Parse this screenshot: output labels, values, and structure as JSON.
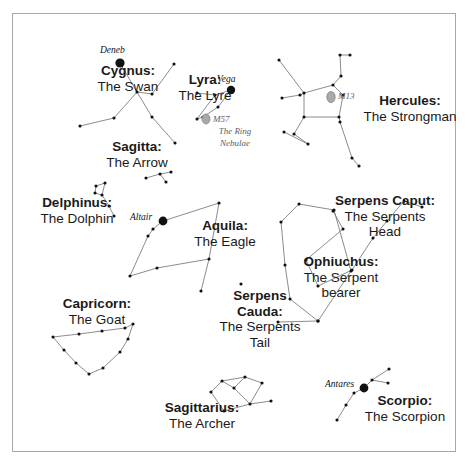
{
  "figure": {
    "kind": "star-chart",
    "background_color": "#ffffff",
    "frame_color": "#a8a8a8",
    "line_color": "#6f6f6f",
    "star_color": "#111111",
    "deepsky_fill": "#a9a9a9"
  },
  "constellations": [
    {
      "key": "cygnus",
      "name": "Cygnus:",
      "common": "The Swan",
      "label": {
        "x": 72,
        "y": 63,
        "w": 112
      },
      "stars": [
        {
          "x": 120,
          "y": 63,
          "r": 4.6,
          "name": "Deneb"
        },
        {
          "x": 137,
          "y": 92
        },
        {
          "x": 152,
          "y": 117
        },
        {
          "x": 175,
          "y": 143
        },
        {
          "x": 174,
          "y": 64
        },
        {
          "x": 152,
          "y": 94
        },
        {
          "x": 114,
          "y": 118
        },
        {
          "x": 80,
          "y": 126
        }
      ],
      "lines": [
        [
          0,
          1
        ],
        [
          1,
          2
        ],
        [
          2,
          3
        ],
        [
          4,
          5
        ],
        [
          5,
          1
        ],
        [
          1,
          6
        ],
        [
          6,
          7
        ]
      ]
    },
    {
      "key": "lyra",
      "name": "Lyra:",
      "common": "The Lyre",
      "label": {
        "x": 166,
        "y": 72,
        "w": 78
      },
      "stars": [
        {
          "x": 231,
          "y": 90,
          "r": 4.2,
          "name": "Vega"
        },
        {
          "x": 215,
          "y": 95
        },
        {
          "x": 197,
          "y": 93
        },
        {
          "x": 218,
          "y": 107
        },
        {
          "x": 203,
          "y": 117
        },
        {
          "x": 197,
          "y": 119
        }
      ],
      "lines": [
        [
          0,
          1
        ],
        [
          1,
          2
        ],
        [
          0,
          3
        ],
        [
          3,
          4
        ],
        [
          4,
          5
        ],
        [
          5,
          1
        ]
      ]
    },
    {
      "key": "hercules",
      "name": "Hercules:",
      "common": "The Strongman",
      "label": {
        "x": 358,
        "y": 93,
        "w": 104
      },
      "stars": [
        {
          "x": 343,
          "y": 95
        },
        {
          "x": 333,
          "y": 85
        },
        {
          "x": 304,
          "y": 93
        },
        {
          "x": 304,
          "y": 117
        },
        {
          "x": 339,
          "y": 117
        },
        {
          "x": 341,
          "y": 76
        },
        {
          "x": 340,
          "y": 55
        },
        {
          "x": 350,
          "y": 55
        },
        {
          "x": 300,
          "y": 95
        },
        {
          "x": 282,
          "y": 98
        },
        {
          "x": 279,
          "y": 60
        },
        {
          "x": 294,
          "y": 134
        },
        {
          "x": 308,
          "y": 144
        },
        {
          "x": 284,
          "y": 132
        },
        {
          "x": 340,
          "y": 122
        },
        {
          "x": 352,
          "y": 158
        },
        {
          "x": 359,
          "y": 166
        }
      ],
      "lines": [
        [
          1,
          2
        ],
        [
          2,
          3
        ],
        [
          3,
          4
        ],
        [
          4,
          0
        ],
        [
          0,
          1
        ],
        [
          1,
          5
        ],
        [
          5,
          6
        ],
        [
          6,
          7
        ],
        [
          2,
          8
        ],
        [
          8,
          9
        ],
        [
          2,
          10
        ],
        [
          3,
          11
        ],
        [
          11,
          12
        ],
        [
          12,
          13
        ],
        [
          4,
          14
        ],
        [
          14,
          15
        ],
        [
          15,
          16
        ]
      ]
    },
    {
      "key": "sagitta",
      "name": "Sagitta:",
      "common": "The Arrow",
      "label": {
        "x": 88,
        "y": 139,
        "w": 98
      },
      "stars": [
        {
          "x": 146,
          "y": 178
        },
        {
          "x": 160,
          "y": 174
        },
        {
          "x": 171,
          "y": 172
        },
        {
          "x": 166,
          "y": 182
        }
      ],
      "lines": [
        [
          0,
          1
        ],
        [
          1,
          2
        ],
        [
          1,
          3
        ]
      ]
    },
    {
      "key": "delphinus",
      "name": "Delphinus:",
      "common": "The Dolphin",
      "label": {
        "x": 25,
        "y": 195,
        "w": 104
      },
      "stars": [
        {
          "x": 96,
          "y": 186
        },
        {
          "x": 105,
          "y": 183
        },
        {
          "x": 102,
          "y": 195
        },
        {
          "x": 95,
          "y": 193
        },
        {
          "x": 109,
          "y": 206
        },
        {
          "x": 114,
          "y": 216
        }
      ],
      "lines": [
        [
          0,
          1
        ],
        [
          1,
          2
        ],
        [
          2,
          3
        ],
        [
          3,
          0
        ],
        [
          2,
          4
        ],
        [
          4,
          5
        ]
      ]
    },
    {
      "key": "aquila",
      "name": "Aquila:",
      "common": "The Eagle",
      "label": {
        "x": 182,
        "y": 218,
        "w": 86
      },
      "stars": [
        {
          "x": 163,
          "y": 221,
          "r": 4.4,
          "name": "Altair"
        },
        {
          "x": 153,
          "y": 229
        },
        {
          "x": 148,
          "y": 236
        },
        {
          "x": 219,
          "y": 203
        },
        {
          "x": 209,
          "y": 259
        },
        {
          "x": 157,
          "y": 268
        },
        {
          "x": 130,
          "y": 276
        },
        {
          "x": 201,
          "y": 291
        }
      ],
      "lines": [
        [
          0,
          1
        ],
        [
          1,
          2
        ],
        [
          0,
          3
        ],
        [
          3,
          4
        ],
        [
          4,
          5
        ],
        [
          5,
          6
        ],
        [
          6,
          2
        ],
        [
          4,
          7
        ]
      ]
    },
    {
      "key": "capricorn",
      "name": "Capricorn:",
      "common": "The Goat",
      "label": {
        "x": 46,
        "y": 296,
        "w": 102
      },
      "stars": [
        {
          "x": 53,
          "y": 337
        },
        {
          "x": 79,
          "y": 334
        },
        {
          "x": 102,
          "y": 331
        },
        {
          "x": 125,
          "y": 328
        },
        {
          "x": 133,
          "y": 324
        },
        {
          "x": 128,
          "y": 339
        },
        {
          "x": 120,
          "y": 352
        },
        {
          "x": 103,
          "y": 368
        },
        {
          "x": 89,
          "y": 374
        },
        {
          "x": 76,
          "y": 363
        },
        {
          "x": 64,
          "y": 350
        }
      ],
      "lines": [
        [
          0,
          1
        ],
        [
          1,
          2
        ],
        [
          2,
          3
        ],
        [
          3,
          4
        ],
        [
          4,
          5
        ],
        [
          5,
          6
        ],
        [
          6,
          7
        ],
        [
          7,
          8
        ],
        [
          8,
          9
        ],
        [
          9,
          10
        ],
        [
          10,
          0
        ]
      ]
    },
    {
      "key": "sagittarius",
      "name": "Sagittarius:",
      "common": "The Archer",
      "label": {
        "x": 146,
        "y": 400,
        "w": 112
      },
      "stars": [
        {
          "x": 211,
          "y": 392
        },
        {
          "x": 222,
          "y": 381
        },
        {
          "x": 245,
          "y": 377
        },
        {
          "x": 234,
          "y": 388
        },
        {
          "x": 262,
          "y": 383
        },
        {
          "x": 250,
          "y": 404
        },
        {
          "x": 271,
          "y": 401
        },
        {
          "x": 224,
          "y": 411
        }
      ],
      "lines": [
        [
          0,
          1
        ],
        [
          1,
          2
        ],
        [
          2,
          3
        ],
        [
          3,
          1
        ],
        [
          2,
          4
        ],
        [
          4,
          5
        ],
        [
          5,
          6
        ],
        [
          5,
          7
        ],
        [
          7,
          0
        ],
        [
          3,
          5
        ]
      ]
    },
    {
      "key": "serpens-caput",
      "name": "Serpens Caput:",
      "common": "The Serpents\nHead",
      "label": {
        "x": 327,
        "y": 193,
        "w": 116
      },
      "stars": [
        {
          "x": 333,
          "y": 211
        },
        {
          "x": 343,
          "y": 229
        },
        {
          "x": 306,
          "y": 260
        },
        {
          "x": 318,
          "y": 286
        },
        {
          "x": 352,
          "y": 270
        },
        {
          "x": 373,
          "y": 238
        },
        {
          "x": 387,
          "y": 221
        },
        {
          "x": 404,
          "y": 201
        },
        {
          "x": 422,
          "y": 207
        }
      ],
      "lines": [
        [
          0,
          1
        ],
        [
          1,
          2
        ],
        [
          2,
          3
        ],
        [
          3,
          4
        ],
        [
          4,
          5
        ],
        [
          5,
          6
        ],
        [
          6,
          7
        ],
        [
          7,
          8
        ]
      ]
    },
    {
      "key": "ophiuchus",
      "name": "Ophiuchus:",
      "common": "The Serpent\nbearer",
      "label": {
        "x": 290,
        "y": 254,
        "w": 102
      },
      "stars": [
        {
          "x": 299,
          "y": 204
        },
        {
          "x": 281,
          "y": 222
        },
        {
          "x": 285,
          "y": 265
        },
        {
          "x": 290,
          "y": 299
        },
        {
          "x": 318,
          "y": 321
        },
        {
          "x": 351,
          "y": 271
        },
        {
          "x": 334,
          "y": 210
        }
      ],
      "lines": [
        [
          0,
          1
        ],
        [
          1,
          2
        ],
        [
          2,
          3
        ],
        [
          3,
          4
        ],
        [
          4,
          5
        ],
        [
          5,
          6
        ],
        [
          6,
          0
        ]
      ]
    },
    {
      "key": "serpens-cauda",
      "name": "Serpens\nCauda:",
      "common": "The Serpents\nTail",
      "label": {
        "x": 206,
        "y": 288,
        "w": 108
      },
      "stars": [
        {
          "x": 241,
          "y": 284
        },
        {
          "x": 278,
          "y": 322
        },
        {
          "x": 318,
          "y": 321
        }
      ],
      "lines": [
        [
          1,
          2
        ]
      ]
    },
    {
      "key": "scorpio",
      "name": "Scorpio:",
      "common": "The Scorpion",
      "label": {
        "x": 353,
        "y": 393,
        "w": 104
      },
      "stars": [
        {
          "x": 364,
          "y": 388,
          "r": 4.4,
          "name": "Antares"
        },
        {
          "x": 372,
          "y": 380
        },
        {
          "x": 389,
          "y": 369
        },
        {
          "x": 388,
          "y": 383
        },
        {
          "x": 354,
          "y": 393
        },
        {
          "x": 346,
          "y": 405
        },
        {
          "x": 337,
          "y": 420
        }
      ],
      "lines": [
        [
          0,
          1
        ],
        [
          1,
          2
        ],
        [
          1,
          3
        ],
        [
          0,
          4
        ],
        [
          4,
          5
        ],
        [
          5,
          6
        ]
      ]
    }
  ],
  "star_labels": [
    {
      "text": "Deneb",
      "x": 100,
      "y": 45
    },
    {
      "text": "Vega",
      "x": 217,
      "y": 74
    },
    {
      "text": "Altair",
      "x": 130,
      "y": 212
    },
    {
      "text": "Antares",
      "x": 325,
      "y": 379
    }
  ],
  "deepsky_objects": [
    {
      "key": "m57",
      "marker": {
        "x": 206,
        "y": 119,
        "rx": 4.0,
        "ry": 5.0
      },
      "label": "M57",
      "label_pos": {
        "x": 213,
        "y": 114
      },
      "sublabel": "The Ring\nNebulae",
      "sublabel_pos": {
        "x": 204,
        "y": 126,
        "w": 62
      }
    },
    {
      "key": "m13",
      "marker": {
        "x": 331,
        "y": 97,
        "rx": 4.2,
        "ry": 5.6
      },
      "label": "M13",
      "label_pos": {
        "x": 338,
        "y": 91
      },
      "sublabel": "",
      "sublabel_pos": {
        "x": 0,
        "y": 0,
        "w": 0
      }
    }
  ]
}
